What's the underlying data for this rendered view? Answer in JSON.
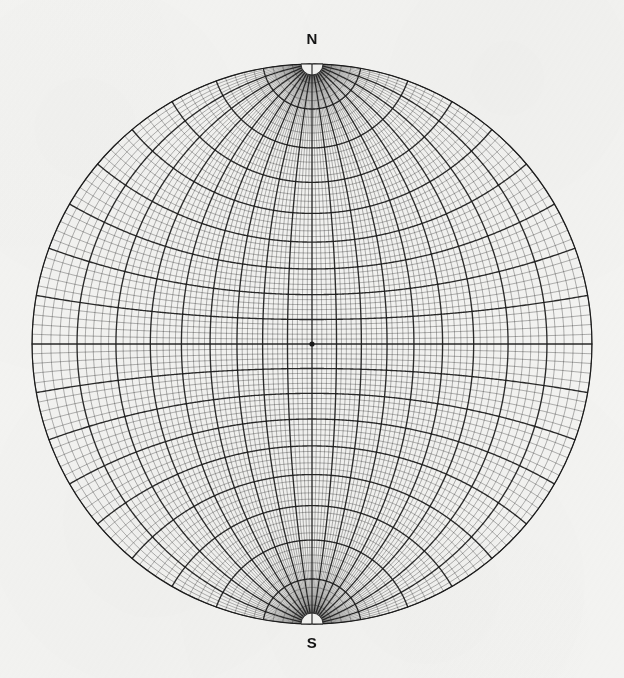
{
  "figure": {
    "kind": "stereographic-projection-net",
    "common_name": "Wulff net",
    "background_color": "#f4f4f2",
    "ink_color": "#1a1a1a"
  },
  "labels": {
    "north": "N",
    "south": "S"
  },
  "chart_data": {
    "type": "scatter",
    "subtitle": "",
    "xlabel": "",
    "ylabel": "",
    "projection": "stereographic-equal-angle",
    "orientation": "meridional",
    "grid": true,
    "legend": "none",
    "annotations": [
      "N",
      "S"
    ],
    "center": {
      "x": 312,
      "y": 344
    },
    "radius_px": 280,
    "primitive_circle_degrees": 90,
    "fine_grid_interval_deg": 2,
    "bold_grid_interval_deg": 10,
    "meridian_range_deg": [
      -90,
      90
    ],
    "parallel_range_deg": [
      -90,
      90
    ],
    "bold_meridian_longitudes_deg": [
      -90,
      -80,
      -70,
      -60,
      -50,
      -40,
      -30,
      -20,
      -10,
      0,
      10,
      20,
      30,
      40,
      50,
      60,
      70,
      80,
      90
    ],
    "bold_parallel_colatitudes_deg": [
      -80,
      -70,
      -60,
      -50,
      -40,
      -30,
      -20,
      -10,
      0,
      10,
      20,
      30,
      40,
      50,
      60,
      70,
      80
    ],
    "equator_emphasized": true,
    "center_marker": true,
    "pole_gap_radius_px": 11,
    "pole_gap_shape": "half-disc",
    "x": [
      0
    ],
    "y": [
      0
    ],
    "xlim": [
      -90,
      90
    ],
    "ylim": [
      -90,
      90
    ]
  }
}
